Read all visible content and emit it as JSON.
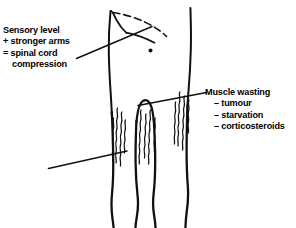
{
  "figure": {
    "ink_color": "#111111",
    "background_color": "#ffffff"
  },
  "callouts": {
    "left": {
      "name": "spinal-cord-compression-callout",
      "lines": [
        {
          "text": "Sensory level",
          "style": "plain"
        },
        {
          "text": "+ stronger arms",
          "style": "plain"
        },
        {
          "text": "= spinal cord",
          "style": "plain"
        },
        {
          "text": "compression",
          "style": "indented"
        }
      ]
    },
    "right": {
      "name": "muscle-wasting-callout",
      "lines": [
        {
          "text": "Muscle wasting",
          "style": "plain"
        },
        {
          "text": "– tumour",
          "style": "bullet"
        },
        {
          "text": "– starvation",
          "style": "bullet"
        },
        {
          "text": "– corticosteroids",
          "style": "bullet"
        }
      ]
    }
  },
  "drawing_elements": {
    "torso_left_edge": "vertical-contour",
    "torso_right_edge": "vertical-contour",
    "shoulder_vertex": "left-shoulder-point",
    "dashed_arc": "shoulder-dashed-arc",
    "nipple_dot": "torso-dot-marker",
    "crotch_arch": "crotch-arch",
    "legs": [
      "left-outer-leg",
      "left-inner-leg",
      "right-inner-leg",
      "right-outer-leg"
    ],
    "wasting_squiggles": [
      "left-thigh-squiggles",
      "mid-thigh-squiggles",
      "right-thigh-squiggles"
    ],
    "pointer_lines": [
      "left-callout-pointer",
      "lower-left-pointer",
      "right-callout-pointer"
    ]
  }
}
